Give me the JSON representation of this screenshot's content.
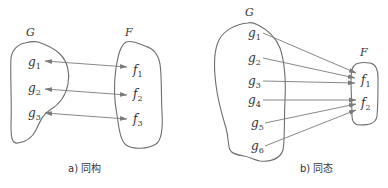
{
  "panels": [
    {
      "id": "a",
      "caption": "a) 同构",
      "source_set": {
        "label": "G",
        "elements": [
          "g1",
          "g2",
          "g3"
        ]
      },
      "target_set": {
        "label": "F",
        "elements": [
          "f1",
          "f2",
          "f3"
        ]
      },
      "mapping": [
        [
          "g1",
          "f1"
        ],
        [
          "g2",
          "f2"
        ],
        [
          "g3",
          "f3"
        ]
      ],
      "arrow_style": "bidirectional"
    },
    {
      "id": "b",
      "caption": "b) 同态",
      "source_set": {
        "label": "G",
        "elements": [
          "g1",
          "g2",
          "g3",
          "g4",
          "g5",
          "g6"
        ]
      },
      "target_set": {
        "label": "F",
        "elements": [
          "f1",
          "f2"
        ]
      },
      "mapping": [
        [
          "g1",
          "f1"
        ],
        [
          "g2",
          "f1"
        ],
        [
          "g3",
          "f1"
        ],
        [
          "g4",
          "f2"
        ],
        [
          "g5",
          "f2"
        ],
        [
          "g6",
          "f2"
        ]
      ],
      "arrow_style": "unidirectional"
    }
  ],
  "labels": {
    "a": {
      "G": "G",
      "F": "F",
      "g": [
        {
          "base": "g",
          "sub": "1"
        },
        {
          "base": "g",
          "sub": "2"
        },
        {
          "base": "g",
          "sub": "3"
        }
      ],
      "f": [
        {
          "base": "f",
          "sub": "1"
        },
        {
          "base": "f",
          "sub": "2"
        },
        {
          "base": "f",
          "sub": "3"
        }
      ],
      "caption": "a) 同构"
    },
    "b": {
      "G": "G",
      "F": "F",
      "g": [
        {
          "base": "g",
          "sub": "1"
        },
        {
          "base": "g",
          "sub": "2"
        },
        {
          "base": "g",
          "sub": "3"
        },
        {
          "base": "g",
          "sub": "4"
        },
        {
          "base": "g",
          "sub": "5"
        },
        {
          "base": "g",
          "sub": "6"
        }
      ],
      "f": [
        {
          "base": "f",
          "sub": "1"
        },
        {
          "base": "f",
          "sub": "2"
        }
      ],
      "caption": "b) 同态"
    }
  },
  "colors": {
    "stroke": "#6e6e6e",
    "text": "#333333",
    "background": "#ffffff"
  }
}
